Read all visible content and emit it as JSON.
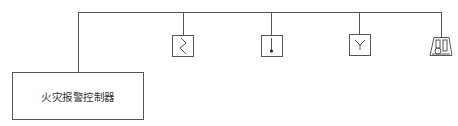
{
  "diagram": {
    "title": "",
    "controller": {
      "label": "火灾报警控制器"
    },
    "devices": [
      {
        "name": "heat-detector",
        "icon": "zigzag-icon"
      },
      {
        "name": "smoke-detector",
        "icon": "line-dot-icon"
      },
      {
        "name": "flame-detector",
        "icon": "y-symbol-icon"
      },
      {
        "name": "alarm-sounder",
        "icon": "trapezoid-sounder-icon"
      }
    ],
    "colors": {
      "line": "#555555",
      "text": "#333333",
      "background": "#ffffff"
    }
  }
}
